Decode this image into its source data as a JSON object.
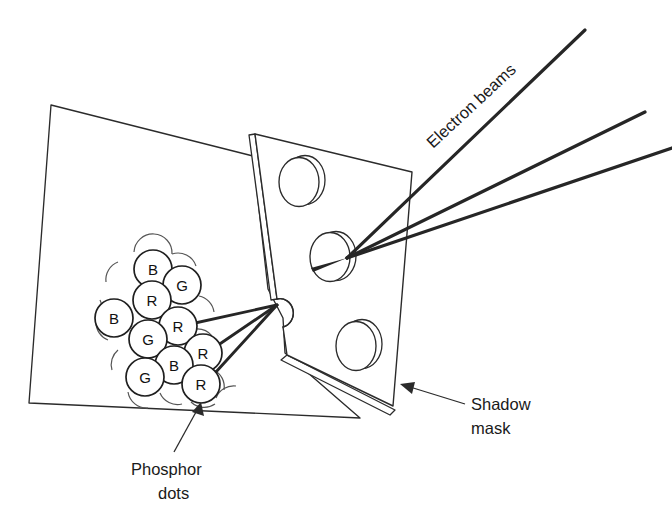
{
  "figure": {
    "stroke_color": "#2b2b2b",
    "beam_color": "#262626",
    "background_color": "#ffffff"
  },
  "labels": {
    "electron_beams": "Electron beams",
    "shadow_mask_line1": "Shadow",
    "shadow_mask_line2": "mask",
    "phosphor_line1": "Phosphor",
    "phosphor_line2": "dots"
  },
  "phosphor_dots": [
    {
      "label": "B",
      "x": 153,
      "y": 269,
      "r": 19
    },
    {
      "label": "G",
      "x": 182,
      "y": 285,
      "r": 19
    },
    {
      "label": "R",
      "x": 152,
      "y": 300,
      "r": 19
    },
    {
      "label": "B",
      "x": 114,
      "y": 318,
      "r": 19
    },
    {
      "label": "R",
      "x": 178,
      "y": 326,
      "r": 19
    },
    {
      "label": "G",
      "x": 148,
      "y": 339,
      "r": 19
    },
    {
      "label": "R",
      "x": 203,
      "y": 353,
      "r": 19
    },
    {
      "label": "B",
      "x": 174,
      "y": 365,
      "r": 19
    },
    {
      "label": "G",
      "x": 145,
      "y": 377,
      "r": 19
    },
    {
      "label": "R",
      "x": 201,
      "y": 384,
      "r": 19
    }
  ],
  "mask_holes": [
    {
      "name": "upper-hole",
      "cx": 300,
      "cy": 181,
      "rx": 21,
      "ry": 25
    },
    {
      "name": "center-hole",
      "cx": 330,
      "cy": 256,
      "rx": 21,
      "ry": 25
    },
    {
      "name": "lower-hole",
      "cx": 356,
      "cy": 345,
      "rx": 21,
      "ry": 25
    }
  ],
  "beams": {
    "count": 3,
    "converge_at_mask_hole": {
      "x": 347,
      "y": 258
    },
    "converge_at_edge_hole": {
      "x": 277,
      "y": 305
    },
    "targets": [
      {
        "dot": "R",
        "x": 186,
        "y": 325
      },
      {
        "dot": "R",
        "x": 208,
        "y": 352
      },
      {
        "dot": "R",
        "x": 205,
        "y": 384
      }
    ]
  }
}
